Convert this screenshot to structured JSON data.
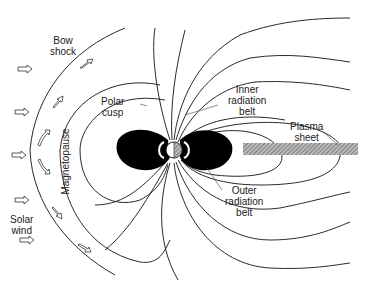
{
  "figure": {
    "labels": {
      "bow_shock": [
        "Bow",
        "shock"
      ],
      "polar_cusp": [
        "Polar",
        "cusp"
      ],
      "magnetopause": "Magnetopause",
      "solar_wind": [
        "Solar",
        "wind"
      ],
      "inner_radiation_belt": [
        "Inner",
        "radiation",
        "belt"
      ],
      "outer_radiation_belt": [
        "Outer",
        "radiation",
        "belt"
      ],
      "plasma_sheet": [
        "Plasma",
        "sheet"
      ]
    },
    "colors": {
      "line": "#2a2a2a",
      "belt_fill": "#000000",
      "plasma_sheet_hatch": "#888888",
      "background": "#ffffff"
    },
    "icons": {
      "solar_wind_arrows": "hollow-right-arrow",
      "deflected_flow_arrows": "hollow-curved-arrow"
    }
  }
}
